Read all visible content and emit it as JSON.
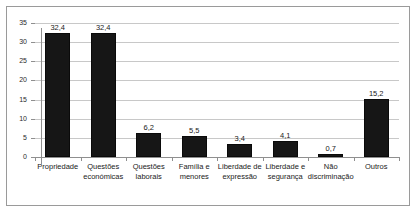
{
  "chart_data": {
    "type": "bar",
    "title": "",
    "xlabel": "",
    "ylabel": "",
    "ylim": [
      0,
      35
    ],
    "ytick_step": 5,
    "grid": true,
    "legend": "none",
    "decimal_separator": ",",
    "bar_color": "#161616",
    "gridline_color": "#c8c8c8",
    "axis_color": "#8f8f8f",
    "frame_color": "#9a9a9a",
    "categories": [
      "Propriedade",
      "Questões económicas",
      "Questões laborais",
      "Família e menores",
      "Liberdade de expressão",
      "Liberdade e segurança",
      "Não discriminação",
      "Outros"
    ],
    "category_lines": [
      [
        "Propriedade",
        ""
      ],
      [
        "Questões",
        "económicas"
      ],
      [
        "Questões",
        "laborais"
      ],
      [
        "Família e",
        "menores"
      ],
      [
        "Liberdade de",
        "expressão"
      ],
      [
        "Liberdade e",
        "segurança"
      ],
      [
        "Não",
        "discriminação"
      ],
      [
        "Outros",
        ""
      ]
    ],
    "values": [
      32.4,
      32.4,
      6.2,
      5.5,
      3.4,
      4.1,
      0.7,
      15.2
    ],
    "value_labels": [
      "32,4",
      "32,4",
      "6,2",
      "5,5",
      "3,4",
      "4,1",
      "0,7",
      "15,2"
    ],
    "ytick_labels": [
      "0",
      "5",
      "10",
      "15",
      "20",
      "25",
      "30",
      "35"
    ],
    "ytick_values": [
      0,
      5,
      10,
      15,
      20,
      25,
      30,
      35
    ]
  }
}
